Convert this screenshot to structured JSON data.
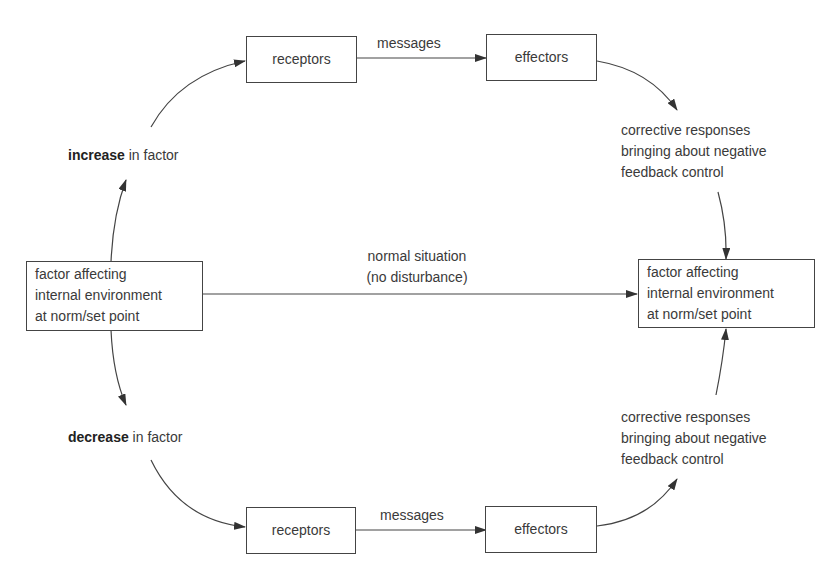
{
  "diagram": {
    "type": "negative-feedback-control",
    "colors": {
      "line": "#444444",
      "text": "#3a3a3a",
      "background": "#ffffff"
    },
    "nodes": {
      "start_factor": [
        "factor affecting",
        "internal environment",
        "at norm/set point"
      ],
      "end_factor": [
        "factor affecting",
        "internal environment",
        "at norm/set point"
      ],
      "top_receptors": "receptors",
      "top_effectors": "effectors",
      "bottom_receptors": "receptors",
      "bottom_effectors": "effectors"
    },
    "labels": {
      "increase": {
        "bold": "increase",
        "rest": " in factor"
      },
      "decrease": {
        "bold": "decrease",
        "rest": " in factor"
      },
      "top_messages": "messages",
      "bottom_messages": "messages",
      "normal": [
        "normal situation",
        "(no disturbance)"
      ],
      "top_corrective": [
        "corrective responses",
        "bringing about negative",
        "feedback control"
      ],
      "bottom_corrective": [
        "corrective responses",
        "bringing about negative",
        "feedback control"
      ]
    },
    "edges": [
      {
        "from": "start_factor",
        "to": "increase"
      },
      {
        "from": "increase",
        "to": "top_receptors"
      },
      {
        "from": "top_receptors",
        "to": "top_effectors",
        "label": "messages"
      },
      {
        "from": "top_effectors",
        "to": "top_corrective"
      },
      {
        "from": "top_corrective",
        "to": "end_factor"
      },
      {
        "from": "start_factor",
        "to": "end_factor",
        "label": "normal situation (no disturbance)"
      },
      {
        "from": "start_factor",
        "to": "decrease"
      },
      {
        "from": "decrease",
        "to": "bottom_receptors"
      },
      {
        "from": "bottom_receptors",
        "to": "bottom_effectors",
        "label": "messages"
      },
      {
        "from": "bottom_effectors",
        "to": "bottom_corrective"
      },
      {
        "from": "bottom_corrective",
        "to": "end_factor"
      }
    ]
  }
}
